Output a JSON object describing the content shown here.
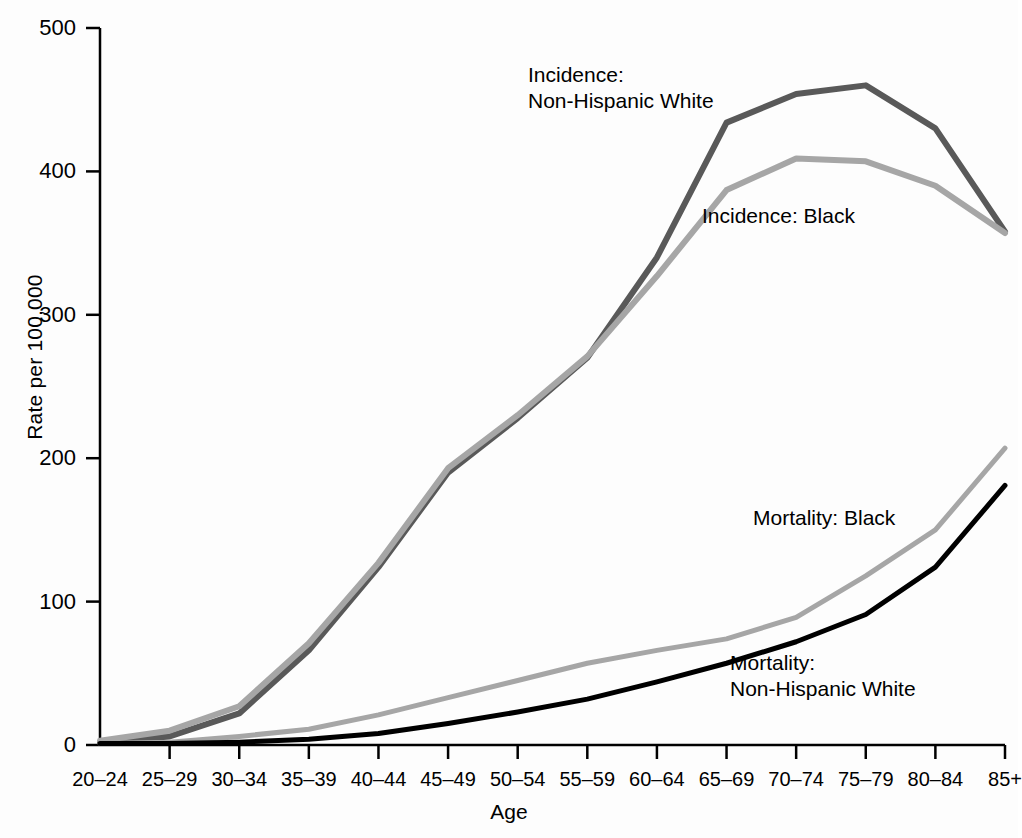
{
  "chart_data": {
    "type": "line",
    "title": "",
    "xlabel": "Age",
    "ylabel": "Rate per 100,000",
    "ylim": [
      0,
      500
    ],
    "yticks": [
      0,
      100,
      200,
      300,
      400,
      500
    ],
    "grid": false,
    "legend_position": "inline-annotations",
    "categories": [
      "20–24",
      "25–29",
      "30–34",
      "35–39",
      "40–44",
      "45–49",
      "50–54",
      "55–59",
      "60–64",
      "65–69",
      "70–74",
      "75–79",
      "80–84",
      "85+"
    ],
    "series": [
      {
        "name": "Incidence: Non-Hispanic White",
        "color": "#595959",
        "width": 6,
        "values": [
          2,
          6,
          22,
          66,
          124,
          190,
          228,
          270,
          340,
          434,
          454,
          460,
          430,
          358
        ]
      },
      {
        "name": "Incidence: Black",
        "color": "#a6a6a6",
        "width": 6,
        "values": [
          3,
          10,
          27,
          71,
          127,
          193,
          230,
          271,
          327,
          387,
          409,
          407,
          390,
          357
        ]
      },
      {
        "name": "Mortality: Black",
        "color": "#a6a6a6",
        "width": 5,
        "values": [
          1,
          2,
          6,
          11,
          21,
          33,
          45,
          57,
          66,
          74,
          89,
          118,
          150,
          207
        ]
      },
      {
        "name": "Mortality: Non-Hispanic White",
        "color": "#000000",
        "width": 5,
        "values": [
          1,
          1,
          2,
          4,
          8,
          15,
          23,
          32,
          44,
          57,
          72,
          91,
          124,
          181
        ]
      }
    ],
    "annotations": [
      {
        "text": "Incidence:\nNon-Hispanic White",
        "x": 528,
        "y": 62
      },
      {
        "text": "Incidence: Black",
        "x": 702,
        "y": 203
      },
      {
        "text": "Mortality: Black",
        "x": 753,
        "y": 505
      },
      {
        "text": "Mortality:\nNon-Hispanic White",
        "x": 730,
        "y": 650
      }
    ]
  }
}
